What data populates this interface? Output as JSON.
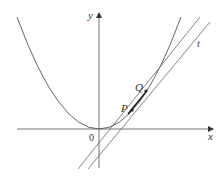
{
  "diagram": {
    "title": "",
    "axes": {
      "x_label": "x",
      "y_label": "y",
      "origin_label": "0"
    },
    "curve": {
      "type": "parabola",
      "equation_shape": "y = x^2",
      "vertex": "origin"
    },
    "points": [
      {
        "name": "P",
        "label": "P"
      },
      {
        "name": "Q",
        "label": "Q"
      }
    ],
    "lines": [
      {
        "name": "secant-PQ",
        "label": ""
      },
      {
        "name": "tangent-t",
        "label": "t"
      }
    ],
    "colors": {
      "stroke": "#555555",
      "text": "#333333",
      "background": "#ffffff"
    }
  }
}
